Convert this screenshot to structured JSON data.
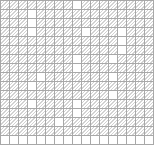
{
  "pattern": {
    "columns": 17,
    "rows": 16,
    "cell_size_px": 9,
    "line_color": "#a8a8a8",
    "hatch_color": "#d2d2d2",
    "background_color": "#ffffff",
    "blank_cells": [
      [
        0,
        8
      ],
      [
        1,
        3
      ],
      [
        2,
        3
      ],
      [
        3,
        3
      ],
      [
        3,
        9
      ],
      [
        3,
        13
      ],
      [
        4,
        13
      ],
      [
        5,
        13
      ],
      [
        6,
        8
      ],
      [
        6,
        12
      ],
      [
        7,
        8
      ],
      [
        8,
        4
      ],
      [
        8,
        12
      ],
      [
        9,
        3
      ],
      [
        10,
        12
      ],
      [
        11,
        3
      ],
      [
        11,
        8
      ],
      [
        12,
        8
      ],
      [
        13,
        6
      ],
      [
        15,
        0
      ],
      [
        15,
        1
      ],
      [
        15,
        2
      ],
      [
        15,
        3
      ],
      [
        15,
        4
      ],
      [
        15,
        5
      ],
      [
        15,
        6
      ],
      [
        15,
        7
      ],
      [
        15,
        8
      ],
      [
        15,
        9
      ],
      [
        15,
        10
      ],
      [
        15,
        11
      ],
      [
        15,
        12
      ],
      [
        15,
        13
      ],
      [
        15,
        14
      ],
      [
        15,
        15
      ],
      [
        15,
        16
      ]
    ]
  }
}
